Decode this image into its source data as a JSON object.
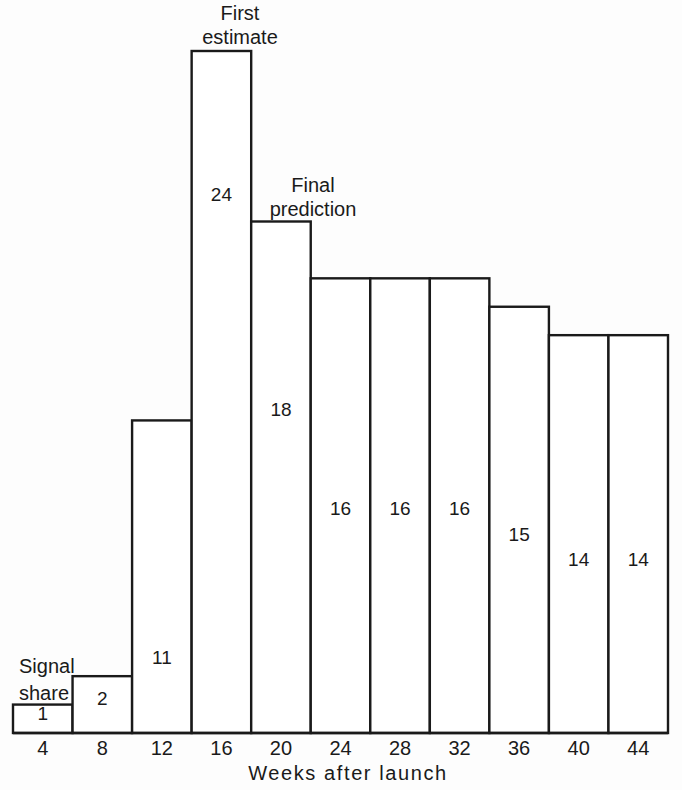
{
  "chart_data": {
    "type": "bar",
    "title": "",
    "subtitle": "",
    "xlabel": "Weeks after launch",
    "ylabel": "Signal share",
    "grid": false,
    "legend": "none",
    "categories": [
      "4",
      "8",
      "12",
      "16",
      "20",
      "24",
      "28",
      "32",
      "36",
      "40",
      "44"
    ],
    "values": [
      1,
      2,
      11,
      24,
      18,
      16,
      16,
      16,
      15,
      14,
      14
    ],
    "value_labels": [
      "1",
      "2",
      "11",
      "24",
      "18",
      "16",
      "16",
      "16",
      "15",
      "14",
      "14"
    ],
    "xlim": [
      2,
      46
    ],
    "ylim": [
      0,
      26
    ],
    "tick_labels": [
      "4",
      "8",
      "12",
      "16",
      "20",
      "24",
      "28",
      "32",
      "36",
      "40",
      "44"
    ],
    "annotations": [
      {
        "id": "first-estimate",
        "lines": [
          "First",
          "estimate"
        ],
        "points_to_category": "16"
      },
      {
        "id": "final-prediction",
        "lines": [
          "Final",
          "prediction"
        ],
        "points_to_category": "20"
      },
      {
        "id": "signal-share",
        "lines": [
          "Signal",
          "share"
        ],
        "points_to_category": "4"
      }
    ]
  },
  "colors": {
    "background": "#fdfdfd",
    "bar_fill": "#ffffff",
    "bar_stroke": "#1a1a1a",
    "axis": "#1a1a1a",
    "text": "#1a1a1a"
  }
}
